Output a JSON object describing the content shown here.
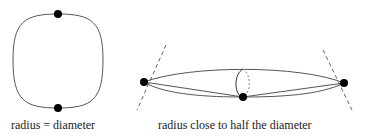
{
  "diagrams": [
    {
      "caption": "radius = diameter"
    },
    {
      "caption": "radius close to half the diameter"
    }
  ],
  "colors": {
    "stroke": "#555555",
    "dot": "#000000",
    "dash": "#666666"
  }
}
